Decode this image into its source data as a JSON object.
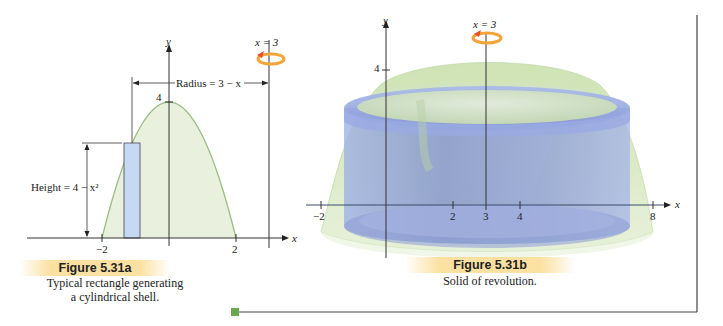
{
  "figure_a": {
    "title": "Figure 5.31a",
    "caption_line1": "Typical rectangle generating",
    "caption_line2": "a cylindrical shell.",
    "axis_y_label": "y",
    "axis_x_label": "x",
    "y_tick_4": "4",
    "x_tick_neg2": "−2",
    "x_tick_2": "2",
    "axis_of_rotation_label": "x = 3",
    "radius_label": "Radius = 3 − x",
    "height_label": "Height = 4 − x²",
    "function": "y = 4 - x^2",
    "curve_color": "#9cbf84",
    "fill_color": "#e8f0dc",
    "rect_color": "#c6d9f2"
  },
  "figure_b": {
    "title": "Figure 5.31b",
    "caption": "Solid of revolution.",
    "axis_y_label": "y",
    "axis_x_label": "x",
    "y_tick_4": "4",
    "x_ticks": [
      "−2",
      "2",
      "3",
      "4",
      "8"
    ],
    "axis_of_rotation_label": "x = 3",
    "solid_color": "#c9dfae",
    "shell_color": "#8a9ad6"
  },
  "colors": {
    "rotation_arrow": "#f2a43a",
    "arrow_head": "#e8502a",
    "frame_accent": "#6aa84f"
  }
}
